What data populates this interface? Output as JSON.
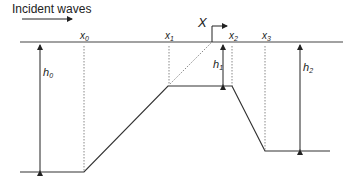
{
  "title": "Incident waves",
  "labels": {
    "x0": "x",
    "x0_sub": "0",
    "x1": "x",
    "x1_sub": "1",
    "x2": "x",
    "x2_sub": "2",
    "x3": "x",
    "x3_sub": "3",
    "X": "X",
    "h0": "h",
    "h0_sub": "0",
    "h1": "h",
    "h1_sub": "1",
    "h2": "h",
    "h2_sub": "2"
  },
  "colors": {
    "line": "#333333",
    "dotted": "#888888"
  }
}
